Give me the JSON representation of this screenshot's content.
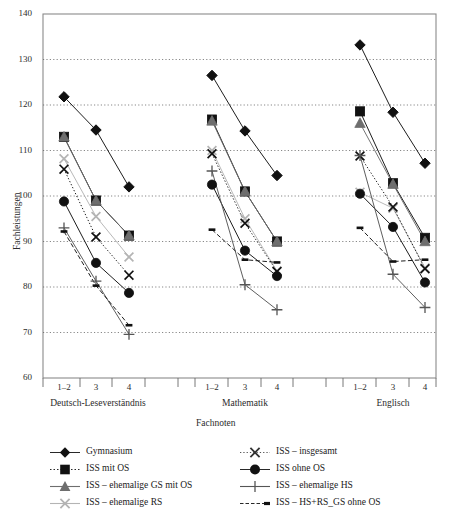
{
  "chart_data": {
    "type": "line",
    "title": "",
    "xlabel": "Fachnoten",
    "ylabel": "Fachleistungen",
    "ylim": [
      60,
      140
    ],
    "ytick_step": 10,
    "yticks": [
      "60",
      "70",
      "80",
      "90",
      "100",
      "110",
      "120",
      "130",
      "140"
    ],
    "grid": "horizontal-dotted",
    "legend_position": "below-plot",
    "groups": [
      {
        "name": "Deutsch-Leseverständnis",
        "categories": [
          "1–2",
          "3",
          "4"
        ]
      },
      {
        "name": "Mathematik",
        "categories": [
          "1–2",
          "3",
          "4"
        ]
      },
      {
        "name": "Englisch",
        "categories": [
          "1–2",
          "3",
          "4"
        ]
      }
    ],
    "categories": [
      "1–2",
      "3",
      "4"
    ],
    "series": [
      {
        "name": "Gymnasium",
        "marker": "diamond",
        "line": "solid",
        "color": "#111111",
        "values": {
          "Deutsch-Leseverständnis": [
            121.8,
            114.5,
            102.0
          ],
          "Mathematik": [
            126.5,
            114.3,
            104.5
          ],
          "Englisch": [
            133.2,
            118.4,
            107.2
          ]
        }
      },
      {
        "name": "ISS mit OS",
        "marker": "square",
        "line": "solid",
        "color": "#111111",
        "values": {
          "Deutsch-Leseverständnis": [
            113.0,
            99.0,
            91.3
          ],
          "Mathematik": [
            116.8,
            101.0,
            90.0
          ],
          "Englisch": [
            118.6,
            102.8,
            90.8
          ]
        }
      },
      {
        "name": "ISS – ehemalige GS mit OS",
        "marker": "triangle",
        "line": "solid",
        "color": "#6e6e6e",
        "values": {
          "Deutsch-Leseverständnis": [
            113.0,
            99.0,
            91.3
          ],
          "Mathematik": [
            116.5,
            101.0,
            90.0
          ],
          "Englisch": [
            116.0,
            102.6,
            90.0
          ]
        }
      },
      {
        "name": "ISS – ehemalige RS",
        "marker": "x",
        "line": "solid",
        "color": "#b4b4b4",
        "values": {
          "Deutsch-Leseverständnis": [
            108.2,
            95.5,
            86.6
          ],
          "Mathematik": [
            110.0,
            95.0,
            83.5
          ],
          "Englisch": [
            100.8,
            97.3,
            84.2
          ]
        }
      },
      {
        "name": "ISS – insgesamt",
        "marker": "x",
        "line": "dotted",
        "color": "#111111",
        "values": {
          "Deutsch-Leseverständnis": [
            105.9,
            91.0,
            82.6
          ],
          "Mathematik": [
            109.3,
            94.0,
            83.4
          ],
          "Englisch": [
            108.8,
            97.6,
            84.0
          ]
        }
      },
      {
        "name": "ISS ohne OS",
        "marker": "circle",
        "line": "solid",
        "color": "#111111",
        "values": {
          "Deutsch-Leseverständnis": [
            98.8,
            85.3,
            78.7
          ],
          "Mathematik": [
            102.5,
            88.0,
            82.4
          ],
          "Englisch": [
            100.5,
            93.2,
            81.0
          ]
        }
      },
      {
        "name": "ISS – ehemalige HS",
        "marker": "plus",
        "line": "solid",
        "color": "#555555",
        "values": {
          "Deutsch-Leseverständnis": [
            93.0,
            81.3,
            69.6
          ],
          "Mathematik": [
            105.5,
            80.5,
            75.0
          ],
          "Englisch": [
            108.9,
            82.8,
            75.5
          ]
        }
      },
      {
        "name": "ISS – HS+RS_GS ohne OS",
        "marker": "dash",
        "line": "dashed",
        "color": "#111111",
        "values": {
          "Deutsch-Leseverständnis": [
            92.2,
            80.3,
            71.6
          ],
          "Mathematik": [
            92.6,
            86.0,
            85.4
          ],
          "Englisch": [
            93.0,
            85.6,
            86.0
          ]
        }
      }
    ]
  },
  "axis": {
    "y_title": "Fachleistungen",
    "x_title": "Fachnoten",
    "yticks": [
      "140",
      "130",
      "120",
      "110",
      "100",
      "90",
      "80",
      "70",
      "60"
    ],
    "xticks": [
      "1–2",
      "3",
      "4",
      "1–2",
      "3",
      "4",
      "1–2",
      "3",
      "4"
    ],
    "group_labels": [
      "Deutsch-Leseverständnis",
      "Mathematik",
      "Englisch"
    ]
  },
  "legend": {
    "left_column": [
      {
        "label": "Gymnasium",
        "marker": "diamond"
      },
      {
        "label": "ISS mit OS",
        "marker": "square"
      },
      {
        "label": "ISS – ehemalige GS mit OS",
        "marker": "triangle"
      },
      {
        "label": "ISS – ehemalige RS",
        "marker": "x-gray"
      }
    ],
    "right_column": [
      {
        "label": "ISS – insgesamt",
        "marker": "x-dotted"
      },
      {
        "label": "ISS ohne OS",
        "marker": "circle"
      },
      {
        "label": "ISS – ehemalige HS",
        "marker": "plus"
      },
      {
        "label": "ISS – HS+RS_GS ohne OS",
        "marker": "dash-dashed"
      }
    ]
  }
}
